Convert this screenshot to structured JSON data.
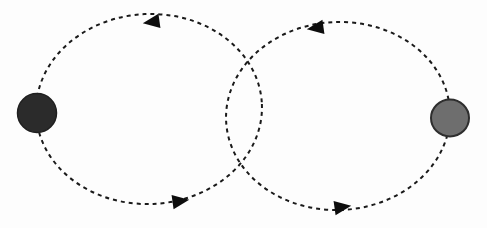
{
  "figure": {
    "type": "diagram",
    "background_color": "#fdfdfd",
    "width": 487,
    "height": 228,
    "stroke_color": "#1a1a1a",
    "stroke_width": 2,
    "dash_pattern": "4 4"
  },
  "nodes": [
    {
      "id": "left-node",
      "name": "left-dark-circle",
      "cx": 37,
      "cy": 113,
      "rx": 19.5,
      "ry": 19.5,
      "fill": "#2b2b2b",
      "stroke": "#1f1f1f",
      "stroke_width": 1.5,
      "shade": "dark"
    },
    {
      "id": "right-node",
      "name": "right-gray-circle",
      "cx": 450,
      "cy": 118,
      "rx": 19,
      "ry": 18.5,
      "fill": "#6e6e6e",
      "stroke": "#2e2e2e",
      "stroke_width": 2,
      "shade": "gray"
    }
  ],
  "orbits": [
    {
      "id": "left-orbit",
      "name": "left-dashed-ellipse",
      "cx": 149,
      "cy": 109,
      "rx": 113,
      "ry": 95,
      "rotation": -2.5,
      "direction": "counter-clockwise",
      "stroke": "#1a1a1a",
      "stroke_width": 2,
      "dash_pattern": "4 4"
    },
    {
      "id": "right-orbit",
      "name": "right-dashed-ellipse",
      "cx": 338,
      "cy": 116,
      "rx": 112,
      "ry": 94,
      "rotation": -2.5,
      "direction": "counter-clockwise",
      "stroke": "#1a1a1a",
      "stroke_width": 2,
      "dash_pattern": "4 4"
    }
  ],
  "arrows": [
    {
      "id": "arrow-top-left",
      "name": "arrow-top-left",
      "x": 152,
      "y": 22,
      "direction": "left",
      "glyph": "triangle-left",
      "rotation": -8,
      "size": 15,
      "fill": "#0d0d0d",
      "on_orbit": "left-orbit"
    },
    {
      "id": "arrow-top-right",
      "name": "arrow-top-right",
      "x": 316,
      "y": 28,
      "direction": "left",
      "glyph": "triangle-left",
      "rotation": -8,
      "size": 15,
      "fill": "#0d0d0d",
      "on_orbit": "right-orbit"
    },
    {
      "id": "arrow-bottom-left",
      "name": "arrow-bottom-left",
      "x": 180,
      "y": 201,
      "direction": "right",
      "glyph": "triangle-right",
      "rotation": -8,
      "size": 15,
      "fill": "#0d0d0d",
      "on_orbit": "left-orbit"
    },
    {
      "id": "arrow-bottom-right",
      "name": "arrow-bottom-right",
      "x": 342,
      "y": 207,
      "direction": "right",
      "glyph": "triangle-right",
      "rotation": -8,
      "size": 15,
      "fill": "#0d0d0d",
      "on_orbit": "right-orbit"
    }
  ],
  "intersections": [
    {
      "name": "upper-crossing",
      "x": 248,
      "y": 48
    },
    {
      "name": "lower-crossing",
      "x": 245,
      "y": 184
    }
  ],
  "labels": {
    "title": "",
    "caption": ""
  }
}
